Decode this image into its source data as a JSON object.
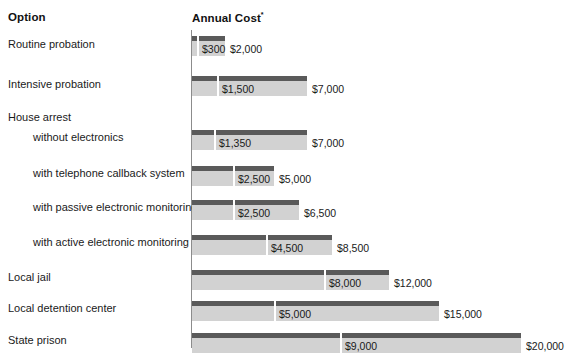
{
  "header": {
    "option_label": "Option",
    "cost_label": "Annual Cost",
    "cost_superscript": "*"
  },
  "colors": {
    "bar_high": "#5a5a5a",
    "bar_low": "#d2d2d2",
    "axis": "#8c8c8c",
    "text": "#1a1a1a",
    "background": "#ffffff"
  },
  "chart_data": {
    "type": "bar",
    "title": "",
    "subtitle": "",
    "xlabel": "Annual Cost",
    "ylabel": "Option",
    "orientation": "horizontal",
    "grid": false,
    "legend": null,
    "xlim": [
      0,
      20000
    ],
    "categories": [
      "Routine probation",
      "Intensive probation",
      "House arrest",
      "without electronics",
      "with telephone callback system",
      "with passive electronic monitoring",
      "with active electronic monitoring",
      "Local jail",
      "Local detention center",
      "State prison"
    ],
    "series": [
      {
        "name": "Low estimate",
        "values": [
          300,
          1500,
          null,
          1350,
          2500,
          2500,
          4500,
          8000,
          5000,
          9000
        ]
      },
      {
        "name": "High estimate",
        "values": [
          2000,
          7000,
          null,
          7000,
          5000,
          6500,
          8500,
          12000,
          15000,
          20000
        ]
      }
    ],
    "rows": [
      {
        "label": "Routine probation",
        "indent": 0,
        "is_group_header": false,
        "low": 300,
        "high": 2000,
        "low_label": "$300",
        "high_label": "$2,000"
      },
      {
        "label": "Intensive probation",
        "indent": 0,
        "is_group_header": false,
        "low": 1500,
        "high": 7000,
        "low_label": "$1,500",
        "high_label": "$7,000"
      },
      {
        "label": "House arrest",
        "indent": 0,
        "is_group_header": true,
        "low": null,
        "high": null,
        "low_label": "",
        "high_label": ""
      },
      {
        "label": "without electronics",
        "indent": 1,
        "is_group_header": false,
        "low": 1350,
        "high": 7000,
        "low_label": "$1,350",
        "high_label": "$7,000"
      },
      {
        "label": "with telephone callback system",
        "indent": 1,
        "is_group_header": false,
        "low": 2500,
        "high": 5000,
        "low_label": "$2,500",
        "high_label": "$5,000"
      },
      {
        "label": "with passive electronic monitoring",
        "indent": 1,
        "is_group_header": false,
        "low": 2500,
        "high": 6500,
        "low_label": "$2,500",
        "high_label": "$6,500"
      },
      {
        "label": "with active electronic monitoring",
        "indent": 1,
        "is_group_header": false,
        "low": 4500,
        "high": 8500,
        "low_label": "$4,500",
        "high_label": "$8,500"
      },
      {
        "label": "Local jail",
        "indent": 0,
        "is_group_header": false,
        "low": 8000,
        "high": 12000,
        "low_label": "$8,000",
        "high_label": "$12,000"
      },
      {
        "label": "Local detention center",
        "indent": 0,
        "is_group_header": false,
        "low": 5000,
        "high": 15000,
        "low_label": "$5,000",
        "high_label": "$15,000"
      },
      {
        "label": "State prison",
        "indent": 0,
        "is_group_header": false,
        "low": 9000,
        "high": 20000,
        "low_label": "$9,000",
        "high_label": "$20,000"
      }
    ]
  }
}
